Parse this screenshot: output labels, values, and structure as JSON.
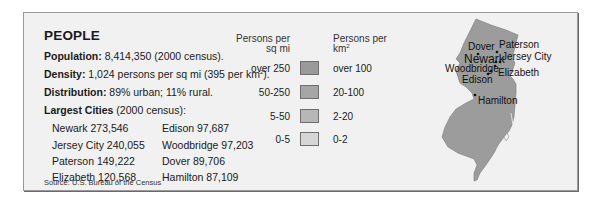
{
  "panel": {
    "title": "PEOPLE",
    "facts": [
      {
        "label": "Population:",
        "value": " 8,414,350 (2000 census)."
      },
      {
        "label": "Density:",
        "value": " 1,024 persons per sq mi (395 per km",
        "sup": "2",
        "tail": ")."
      },
      {
        "label": "Distribution:",
        "value": " 89% urban; 11% rural."
      },
      {
        "label": "Largest Cities",
        "value": " (2000 census):"
      }
    ],
    "cities_left": [
      "Newark 273,546",
      "Jersey City 240,055",
      "Paterson 149,222",
      "Elizabeth 120,568"
    ],
    "cities_right": [
      "Edison 97,687",
      "Woodbridge 97,203",
      "Dover 89,706",
      "Hamilton 87,109"
    ],
    "source": "Source: U.S. Bureau of the Census"
  },
  "legend": {
    "header_left_1": "Persons per",
    "header_left_2": "sq mi",
    "header_right_1": "Persons per",
    "header_right_2": "km",
    "header_right_sup": "2",
    "rows": [
      {
        "sq_mi": "over 250",
        "km2": "over 100",
        "color": "#9a9a9a"
      },
      {
        "sq_mi": "50-250",
        "km2": "20-100",
        "color": "#a6a6a6"
      },
      {
        "sq_mi": "5-50",
        "km2": "2-20",
        "color": "#b7b7b7"
      },
      {
        "sq_mi": "0-5",
        "km2": "0-2",
        "color": "#d6d6d6"
      }
    ]
  },
  "map": {
    "fill": "#9c9c9c",
    "labels": {
      "dover": "Dover",
      "paterson": "Paterson",
      "newark": "Newark",
      "jersey_city": "Jersey City",
      "woodbridge": "Woodbridge",
      "elizabeth": "Elizabeth",
      "edison": "Edison",
      "hamilton": "Hamilton"
    }
  }
}
